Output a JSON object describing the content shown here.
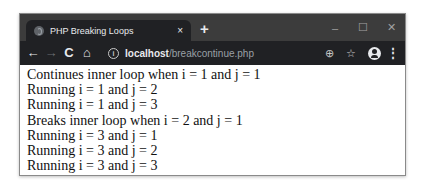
{
  "browser": {
    "tab": {
      "favicon": "globe-icon",
      "title": "PHP Breaking Loops",
      "close_label": "×"
    },
    "new_tab_label": "+",
    "window_controls": {
      "minimize": "–",
      "maximize": "☐",
      "close": "✕"
    },
    "toolbar": {
      "back": "←",
      "forward": "→",
      "reload": "C",
      "home": "⌂",
      "info": "i",
      "url_host": "localhost",
      "url_path": "/breakcontinue.php",
      "zoom": "⊕",
      "bookmark": "☆",
      "menu": "⋮"
    }
  },
  "page": {
    "lines": [
      "Continues inner loop when i = 1 and j = 1",
      "Running i = 1 and j = 2",
      "Running i = 1 and j = 3",
      "Breaks inner loop when i = 2 and j = 1",
      "Running i = 3 and j = 1",
      "Running i = 3 and j = 2",
      "Running i = 3 and j = 3"
    ]
  },
  "colors": {
    "titlebar": "#3c3c3c",
    "toolbar": "#202124",
    "text": "#111111"
  }
}
